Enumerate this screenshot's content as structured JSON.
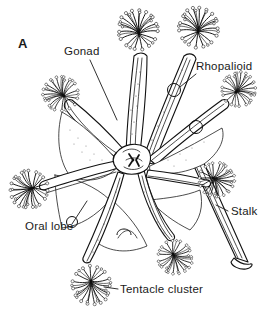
{
  "figure": {
    "panel_label": "A",
    "background_color": "#ffffff",
    "ink_color": "#111111",
    "width": 269,
    "height": 321
  },
  "labels": [
    {
      "id": "panel",
      "text": "A",
      "x": 18,
      "y": 48,
      "anchor": "start",
      "bold": true,
      "has_leader": false
    },
    {
      "id": "gonad",
      "text": "Gonad",
      "x": 64,
      "y": 55,
      "anchor": "start",
      "bold": false,
      "has_leader": true,
      "leader_path": "M 90 60 L 117 120"
    },
    {
      "id": "rhopalioid",
      "text": "Rhopalioid",
      "x": 196,
      "y": 70,
      "anchor": "start",
      "bold": false,
      "has_leader": true,
      "leader_path": "M 196 74 L 178 88"
    },
    {
      "id": "stalk",
      "text": "Stalk",
      "x": 229,
      "y": 215,
      "anchor": "start",
      "bold": false,
      "has_leader": true,
      "leader_path": "M 228 211 L 218 206"
    },
    {
      "id": "oral-lobe",
      "text": "Oral lobe",
      "x": 25,
      "y": 230,
      "anchor": "start",
      "bold": false,
      "has_leader": true,
      "leader_path": "M 72 224 L 86 202"
    },
    {
      "id": "tentacle-cluster",
      "text": "Tentacle  cluster",
      "x": 120,
      "y": 293,
      "anchor": "start",
      "bold": false,
      "has_leader": true,
      "leader_path": "M 118 289 L 105 287"
    }
  ],
  "anatomy": {
    "arm_count": 8,
    "tentacle_clusters": [
      {
        "id": "cluster-top-left",
        "cx": 139,
        "cy": 34,
        "r": 20,
        "rot": -12
      },
      {
        "id": "cluster-top-right",
        "cx": 198,
        "cy": 32,
        "r": 20,
        "rot": 8
      },
      {
        "id": "cluster-left-upper",
        "cx": 64,
        "cy": 96,
        "r": 17,
        "rot": -52
      },
      {
        "id": "cluster-right-upper",
        "cx": 236,
        "cy": 92,
        "r": 17,
        "rot": 48
      },
      {
        "id": "cluster-left-lower",
        "cx": 33,
        "cy": 188,
        "r": 19,
        "rot": -108
      },
      {
        "id": "cluster-right-lower",
        "cx": 213,
        "cy": 178,
        "r": 17,
        "rot": 118
      },
      {
        "id": "cluster-bottom",
        "cx": 91,
        "cy": 281,
        "r": 20,
        "rot": 176
      },
      {
        "id": "cluster-bottom-mid",
        "cx": 173,
        "cy": 254,
        "r": 17,
        "rot": 150
      }
    ],
    "rhopalioid_markers": [
      {
        "id": "rhopalioid-upper-right",
        "cx": 174,
        "cy": 90,
        "r": 6.5
      },
      {
        "id": "rhopalioid-mid-right",
        "cx": 196,
        "cy": 127,
        "r": 6.5
      },
      {
        "id": "rhopalioid-left",
        "cx": 72,
        "cy": 222,
        "r": 5.5
      },
      {
        "id": "rhopalioid-bottom",
        "cx": 124,
        "cy": 232,
        "r": 7.5
      }
    ],
    "stalk": {
      "id": "stalk-structure",
      "top_x": 188,
      "top_y": 150,
      "foot_x": 243,
      "foot_y": 267
    },
    "central_disc": {
      "cx": 130,
      "cy": 160,
      "rx": 18,
      "ry": 16
    }
  }
}
